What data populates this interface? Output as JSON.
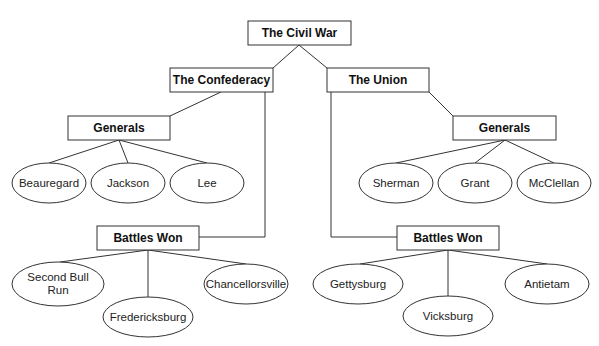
{
  "diagram": {
    "root": {
      "label": "The Civil War",
      "x": 248,
      "y": 21,
      "w": 103,
      "h": 24
    },
    "confederacy": {
      "label": "The Confederacy",
      "x": 170,
      "y": 68,
      "w": 103,
      "h": 24,
      "generals": {
        "label": "Generals",
        "x": 68,
        "y": 116,
        "w": 102,
        "h": 24,
        "items": [
          {
            "label": "Beauregard",
            "cx": 49,
            "cy": 183,
            "rx": 37,
            "ry": 20
          },
          {
            "label": "Jackson",
            "cx": 128,
            "cy": 183,
            "rx": 37,
            "ry": 20
          },
          {
            "label": "Lee",
            "cx": 207,
            "cy": 183,
            "rx": 37,
            "ry": 20
          }
        ]
      },
      "battles": {
        "label": "Battles Won",
        "x": 97,
        "y": 226,
        "w": 102,
        "h": 24,
        "items": [
          {
            "label_line1": "Second Bull",
            "label_line2": "Run",
            "cx": 58,
            "cy": 284,
            "rx": 46,
            "ry": 22
          },
          {
            "label": "Fredericksburg",
            "cx": 148,
            "cy": 317,
            "rx": 45,
            "ry": 20
          },
          {
            "label": "Chancellorsville",
            "cx": 246,
            "cy": 284,
            "rx": 42,
            "ry": 20
          }
        ]
      }
    },
    "union": {
      "label": "The Union",
      "x": 327,
      "y": 68,
      "w": 102,
      "h": 24,
      "generals": {
        "label": "Generals",
        "x": 453,
        "y": 116,
        "w": 103,
        "h": 24,
        "items": [
          {
            "label": "Sherman",
            "cx": 396,
            "cy": 183,
            "rx": 37,
            "ry": 20
          },
          {
            "label": "Grant",
            "cx": 475,
            "cy": 183,
            "rx": 37,
            "ry": 20
          },
          {
            "label": "McClellan",
            "cx": 554,
            "cy": 183,
            "rx": 37,
            "ry": 20
          }
        ]
      },
      "battles": {
        "label": "Battles Won",
        "x": 397,
        "y": 226,
        "w": 102,
        "h": 24,
        "items": [
          {
            "label": "Gettysburg",
            "cx": 358,
            "cy": 284,
            "rx": 45,
            "ry": 20
          },
          {
            "label": "Vicksburg",
            "cx": 448,
            "cy": 316,
            "rx": 45,
            "ry": 20
          },
          {
            "label": "Antietam",
            "cx": 547,
            "cy": 284,
            "rx": 42,
            "ry": 20
          }
        ]
      }
    }
  }
}
